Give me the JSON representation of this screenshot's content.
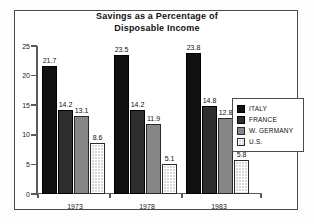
{
  "chart_data": {
    "type": "bar",
    "title": "Savings as a Percentage of Disposable Income",
    "title_line1": "Savings as a Percentage of",
    "title_line2": "Disposable Income",
    "xlabel": "",
    "ylabel": "",
    "ylim": [
      0,
      25
    ],
    "yticks": [
      0,
      5,
      10,
      15,
      20,
      25
    ],
    "ytick_labels": [
      "0",
      "5",
      "10",
      "15",
      "20",
      "25"
    ],
    "grid": false,
    "legend_position": "right",
    "categories": [
      "1973",
      "1978",
      "1983"
    ],
    "series": [
      {
        "name": "ITALY",
        "color": "#111111",
        "values": [
          21.7,
          23.5,
          23.8
        ],
        "labels": [
          "21.7",
          "23.5",
          "23.8"
        ]
      },
      {
        "name": "FRANCE",
        "color": "#2e2e2e",
        "values": [
          14.2,
          14.2,
          14.8
        ],
        "labels": [
          "14.2",
          "14.2",
          "14.8"
        ]
      },
      {
        "name": "W. GERMANY",
        "color": "#868686",
        "values": [
          13.1,
          11.9,
          12.8
        ],
        "labels": [
          "13.1",
          "11.9",
          "12.8"
        ]
      },
      {
        "name": "U.S.",
        "color": "#d8d8d8",
        "values": [
          8.6,
          5.1,
          5.8
        ],
        "labels": [
          "8.6",
          "5.1",
          "5.8"
        ]
      }
    ]
  }
}
